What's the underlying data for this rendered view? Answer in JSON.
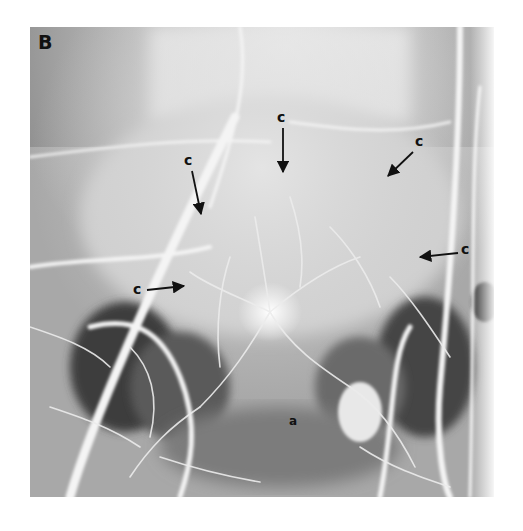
{
  "figure": {
    "panel_label": "B",
    "image_type": "angiogram (grayscale X-ray)",
    "annotations": [
      {
        "id": "c1",
        "text": "c",
        "x": 277,
        "y": 112,
        "arrow": {
          "x1": 283,
          "y1": 128,
          "x2": 283,
          "y2": 172
        }
      },
      {
        "id": "c2",
        "text": "c",
        "x": 415,
        "y": 136,
        "arrow": {
          "x1": 413,
          "y1": 152,
          "x2": 388,
          "y2": 176
        }
      },
      {
        "id": "c3",
        "text": "c",
        "x": 184,
        "y": 155,
        "arrow": {
          "x1": 192,
          "y1": 171,
          "x2": 201,
          "y2": 214
        }
      },
      {
        "id": "c4",
        "text": "c",
        "x": 461,
        "y": 244,
        "arrow": {
          "x1": 458,
          "y1": 253,
          "x2": 420,
          "y2": 257
        }
      },
      {
        "id": "c5",
        "text": "c",
        "x": 133,
        "y": 284,
        "arrow": {
          "x1": 147,
          "y1": 290,
          "x2": 184,
          "y2": 286
        }
      },
      {
        "id": "a",
        "text": "a",
        "x": 289,
        "y": 416
      }
    ]
  },
  "colors": {
    "background": "#ffffff",
    "image_mid_gray": "#9c9c9c",
    "label_ink": "#111111"
  }
}
